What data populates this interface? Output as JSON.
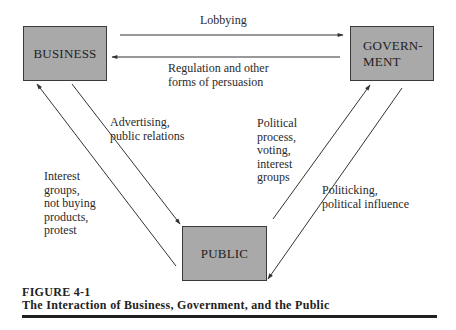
{
  "figure": {
    "number": "FIGURE 4-1",
    "title": "The Interaction of Business, Government, and the Public"
  },
  "nodes": {
    "business": {
      "label": "BUSINESS"
    },
    "government": {
      "label": "GOVERN-\nMENT"
    },
    "public": {
      "label": "PUBLIC"
    }
  },
  "edges": {
    "lobbying": {
      "from": "business",
      "to": "government",
      "label": "Lobbying"
    },
    "regulation": {
      "from": "government",
      "to": "business",
      "label": "Regulation and other\nforms of persuasion"
    },
    "advertising": {
      "from": "business",
      "to": "public",
      "label": "Advertising,\npublic relations"
    },
    "interest_groups": {
      "from": "public",
      "to": "business",
      "label": "Interest\ngroups,\nnot buying\nproducts,\nprotest"
    },
    "political_process": {
      "from": "public",
      "to": "government",
      "label": "Political\nprocess,\nvoting,\ninterest\ngroups"
    },
    "politicking": {
      "from": "government",
      "to": "public",
      "label": "Politicking,\npolitical influence"
    }
  },
  "colors": {
    "node_fill": "#a9a9a9",
    "node_border": "#3a3a3a",
    "line": "#333333",
    "text": "#2a2a2a"
  }
}
